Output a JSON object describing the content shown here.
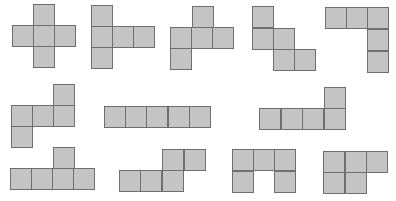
{
  "style": {
    "fill": "#c4c4c4",
    "stroke": "#6f6f6f",
    "background": "#ffffff",
    "cell_px": 21
  },
  "nets": [
    {
      "id": "net-1",
      "cells": [
        [
          33,
          4
        ],
        [
          12,
          25
        ],
        [
          33,
          25
        ],
        [
          54,
          25
        ],
        [
          33,
          46
        ]
      ]
    },
    {
      "id": "net-2",
      "cells": [
        [
          91,
          5
        ],
        [
          91,
          26
        ],
        [
          112,
          26
        ],
        [
          133,
          26
        ],
        [
          91,
          47
        ]
      ]
    },
    {
      "id": "net-3",
      "cells": [
        [
          192,
          6
        ],
        [
          170,
          27
        ],
        [
          191,
          27
        ],
        [
          212,
          27
        ],
        [
          170,
          48
        ]
      ]
    },
    {
      "id": "net-4",
      "cells": [
        [
          252,
          6
        ],
        [
          252,
          28
        ],
        [
          273,
          28
        ],
        [
          273,
          49
        ],
        [
          294,
          49
        ]
      ]
    },
    {
      "id": "net-5",
      "cells": [
        [
          325,
          7
        ],
        [
          346,
          7
        ],
        [
          367,
          7
        ],
        [
          367,
          29
        ],
        [
          367,
          51
        ]
      ]
    },
    {
      "id": "net-6",
      "cells": [
        [
          53,
          84
        ],
        [
          11,
          105
        ],
        [
          32,
          105
        ],
        [
          53,
          105
        ],
        [
          11,
          126
        ]
      ]
    },
    {
      "id": "net-7",
      "cells": [
        [
          104,
          106
        ],
        [
          125,
          106
        ],
        [
          146,
          106
        ],
        [
          168,
          106
        ],
        [
          189,
          106
        ]
      ]
    },
    {
      "id": "net-8",
      "cells": [
        [
          324,
          87
        ],
        [
          259,
          108
        ],
        [
          281,
          108
        ],
        [
          302,
          108
        ],
        [
          324,
          108
        ]
      ]
    },
    {
      "id": "net-9",
      "cells": [
        [
          53,
          147
        ],
        [
          10,
          168
        ],
        [
          31,
          168
        ],
        [
          52,
          168
        ],
        [
          73,
          168
        ]
      ]
    },
    {
      "id": "net-10",
      "cells": [
        [
          162,
          149
        ],
        [
          184,
          149
        ],
        [
          119,
          170
        ],
        [
          140,
          170
        ],
        [
          162,
          170
        ]
      ]
    },
    {
      "id": "net-11",
      "cells": [
        [
          232,
          149
        ],
        [
          253,
          149
        ],
        [
          274,
          149
        ],
        [
          232,
          171
        ],
        [
          274,
          171
        ]
      ]
    },
    {
      "id": "net-12",
      "cells": [
        [
          323,
          151
        ],
        [
          345,
          151
        ],
        [
          366,
          151
        ],
        [
          323,
          172
        ],
        [
          345,
          172
        ]
      ]
    }
  ]
}
